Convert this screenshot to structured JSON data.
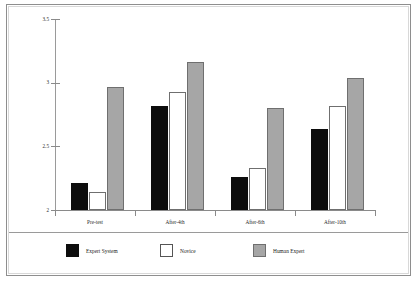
{
  "chart_data": {
    "type": "bar",
    "title": "",
    "subtitle": "",
    "xlabel": "",
    "ylabel": "",
    "categories": [
      "Pre-test",
      "After-4th",
      "After-6th",
      "After-10th"
    ],
    "series": [
      {
        "name": "Expert System",
        "color": "#0d0d0d",
        "values": [
          2.21,
          2.82,
          2.26,
          2.64
        ]
      },
      {
        "name": "Novice",
        "color": "#ffffff",
        "values": [
          2.14,
          2.93,
          2.33,
          2.82
        ]
      },
      {
        "name": "Human Expert",
        "color": "#a6a6a6",
        "values": [
          2.97,
          3.16,
          2.8,
          3.04
        ]
      }
    ],
    "ylim": [
      2,
      3.5
    ],
    "yticks": [
      2,
      2.5,
      3,
      3.5
    ],
    "ytick_labels": [
      "2",
      "2.5",
      "3",
      "3.5"
    ],
    "grid": false,
    "legend_position": "bottom"
  },
  "legend": {
    "items": [
      {
        "label": "Expert System",
        "swatch": "black-square-swatch"
      },
      {
        "label": "Novice",
        "swatch": "white-square-swatch"
      },
      {
        "label": "Human Expert",
        "swatch": "gray-square-swatch"
      }
    ]
  },
  "colors": {
    "expert_system": "#0d0d0d",
    "novice": "#ffffff",
    "human_expert": "#a6a6a6",
    "axis": "#8a8a8a",
    "frame": "#8e8e8e",
    "background": "#ffffff"
  }
}
